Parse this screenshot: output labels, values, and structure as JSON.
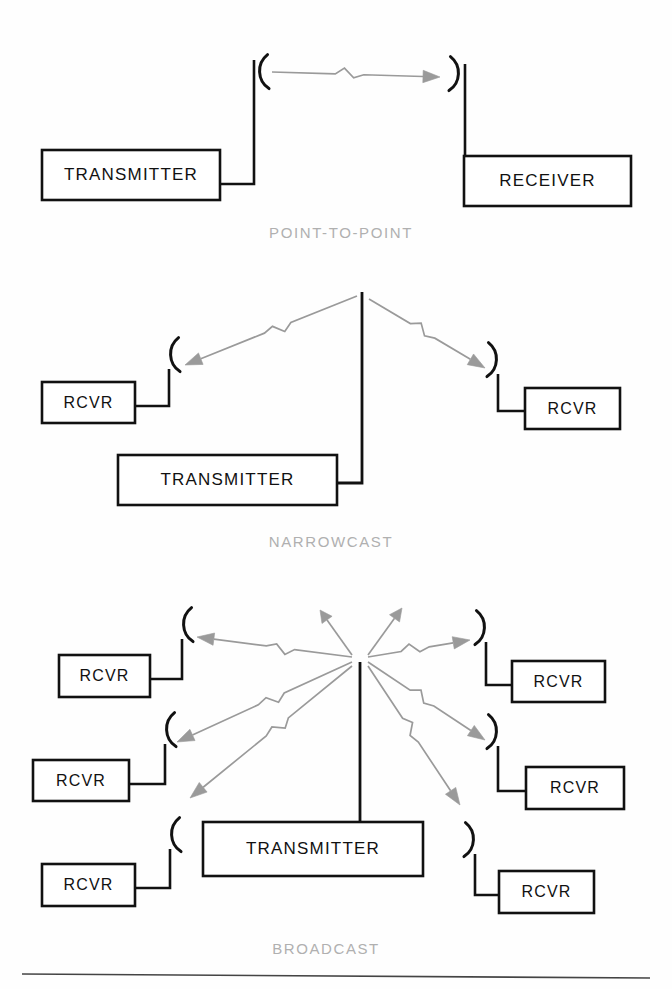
{
  "figure": {
    "title_visible": false,
    "background": "#ffffff",
    "line_color": "#111111",
    "signal_color": "#9a9a9a",
    "caption_color": "#b0b0b0",
    "rule_color": "#444444"
  },
  "sections": [
    {
      "id": "point-to-point",
      "caption": "POINT-TO-POINT",
      "caption_x": 341,
      "caption_y": 224,
      "nodes": [
        {
          "id": "p2p-transmitter",
          "label": "TRANSMITTER",
          "x": 42,
          "y": 150,
          "w": 178,
          "h": 50,
          "font": 17,
          "side": "left"
        },
        {
          "id": "p2p-receiver",
          "label": "RECEIVER",
          "x": 464,
          "y": 156,
          "w": 167,
          "h": 50,
          "font": 17,
          "side": "right"
        }
      ],
      "antennas": [
        {
          "id": "p2p-tx-antenna",
          "cx": 256,
          "cy": 72,
          "open": "right"
        },
        {
          "id": "p2p-rx-antenna",
          "cx": 462,
          "cy": 74,
          "open": "left"
        }
      ],
      "signals": [
        {
          "id": "p2p-signal",
          "from": [
            272,
            72
          ],
          "to": [
            440,
            77
          ],
          "direction": "right"
        }
      ]
    },
    {
      "id": "narrowcast",
      "caption": "NARROWCAST",
      "caption_x": 331,
      "caption_y": 533,
      "nodes": [
        {
          "id": "nc-transmitter",
          "label": "TRANSMITTER",
          "x": 118,
          "y": 455,
          "w": 219,
          "h": 50,
          "font": 17,
          "side": "right-mast"
        },
        {
          "id": "nc-rcvr-left",
          "label": "RCVR",
          "x": 42,
          "y": 382,
          "w": 93,
          "h": 41,
          "font": 16,
          "side": "left"
        },
        {
          "id": "nc-rcvr-right",
          "label": "RCVR",
          "x": 525,
          "y": 388,
          "w": 95,
          "h": 41,
          "font": 16,
          "side": "right"
        }
      ],
      "antennas": [
        {
          "id": "nc-left-antenna",
          "cx": 167,
          "cy": 355,
          "open": "right"
        },
        {
          "id": "nc-right-antenna",
          "cx": 500,
          "cy": 360,
          "open": "left"
        }
      ],
      "mast": {
        "x": 362,
        "y_top": 292,
        "y_bottom": 483
      },
      "signals": [
        {
          "id": "nc-signal-left",
          "from": [
            357,
            296
          ],
          "to": [
            185,
            365
          ],
          "direction": "left"
        },
        {
          "id": "nc-signal-right",
          "from": [
            369,
            299
          ],
          "to": [
            485,
            368
          ],
          "direction": "right"
        }
      ]
    },
    {
      "id": "broadcast",
      "caption": "BROADCAST",
      "caption_x": 326,
      "caption_y": 940,
      "nodes": [
        {
          "id": "bc-transmitter",
          "label": "TRANSMITTER",
          "x": 203,
          "y": 822,
          "w": 220,
          "h": 54,
          "font": 17,
          "side": "top-mast"
        },
        {
          "id": "bc-rcvr-l1",
          "label": "RCVR",
          "x": 59,
          "y": 655,
          "w": 91,
          "h": 42,
          "font": 16,
          "side": "left"
        },
        {
          "id": "bc-rcvr-l2",
          "label": "RCVR",
          "x": 33,
          "y": 760,
          "w": 96,
          "h": 41,
          "font": 16,
          "side": "left"
        },
        {
          "id": "bc-rcvr-l3",
          "label": "RCVR",
          "x": 42,
          "y": 864,
          "w": 93,
          "h": 42,
          "font": 16,
          "side": "left"
        },
        {
          "id": "bc-rcvr-r1",
          "label": "RCVR",
          "x": 512,
          "y": 661,
          "w": 93,
          "h": 41,
          "font": 16,
          "side": "right"
        },
        {
          "id": "bc-rcvr-r2",
          "label": "RCVR",
          "x": 526,
          "y": 767,
          "w": 98,
          "h": 42,
          "font": 16,
          "side": "right"
        },
        {
          "id": "bc-rcvr-r3",
          "label": "RCVR",
          "x": 499,
          "y": 871,
          "w": 95,
          "h": 42,
          "font": 16,
          "side": "right"
        }
      ],
      "antennas": [
        {
          "id": "bc-antenna-l1",
          "cx": 180,
          "cy": 625,
          "open": "right"
        },
        {
          "id": "bc-antenna-l2",
          "cx": 163,
          "cy": 730,
          "open": "right"
        },
        {
          "id": "bc-antenna-l3",
          "cx": 168,
          "cy": 835,
          "open": "right"
        },
        {
          "id": "bc-antenna-r1",
          "cx": 488,
          "cy": 628,
          "open": "left"
        },
        {
          "id": "bc-antenna-r2",
          "cx": 500,
          "cy": 732,
          "open": "left"
        },
        {
          "id": "bc-antenna-r3",
          "cx": 477,
          "cy": 840,
          "open": "left"
        }
      ],
      "mast": {
        "x": 360,
        "y_top": 662,
        "y_bottom": 822
      },
      "hub": [
        360,
        661
      ],
      "signals": [
        {
          "id": "bc-signal-up-left",
          "from": [
            352,
            655
          ],
          "to": [
            320,
            610
          ],
          "direction": "up-left",
          "short": true
        },
        {
          "id": "bc-signal-up-right",
          "from": [
            368,
            655
          ],
          "to": [
            402,
            608
          ],
          "direction": "up-right",
          "short": true
        },
        {
          "id": "bc-signal-l1",
          "from": [
            352,
            657
          ],
          "to": [
            197,
            637
          ],
          "direction": "left"
        },
        {
          "id": "bc-signal-l2",
          "from": [
            352,
            662
          ],
          "to": [
            177,
            742
          ],
          "direction": "left-down"
        },
        {
          "id": "bc-signal-l3",
          "from": [
            352,
            666
          ],
          "to": [
            190,
            798
          ],
          "direction": "left-down"
        },
        {
          "id": "bc-signal-r1",
          "from": [
            368,
            657
          ],
          "to": [
            470,
            640
          ],
          "direction": "right"
        },
        {
          "id": "bc-signal-r2",
          "from": [
            368,
            662
          ],
          "to": [
            485,
            740
          ],
          "direction": "right-down"
        },
        {
          "id": "bc-signal-r3",
          "from": [
            368,
            666
          ],
          "to": [
            460,
            805
          ],
          "direction": "right-down"
        }
      ]
    }
  ],
  "footer_rule": {
    "x1": 22,
    "y1": 974,
    "x2": 650,
    "y2": 978
  }
}
